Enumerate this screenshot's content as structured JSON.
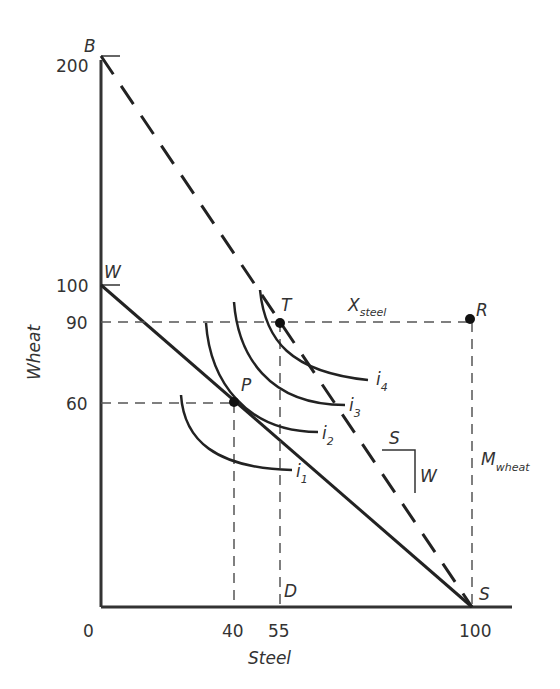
{
  "diagram": {
    "type": "trade-gains-ppf",
    "axes": {
      "x_label": "Steel",
      "y_label": "Wheat",
      "origin_label": "0",
      "x_ticks": [
        "40",
        "55",
        "100"
      ],
      "y_ticks": [
        "200",
        "100",
        "90",
        "60"
      ]
    },
    "points": {
      "B": "B",
      "W": "W",
      "T": "T",
      "P": "P",
      "R": "R",
      "D": "D",
      "S": "S"
    },
    "lines": {
      "production_frontier": "W to S (solid): Wheat 100 to Steel 100",
      "trade_line": "B to S (dashed): Wheat 200 to Steel 100"
    },
    "indifference_curves": {
      "i1": {
        "base": "i",
        "sub": "1"
      },
      "i2": {
        "base": "i",
        "sub": "2"
      },
      "i3": {
        "base": "i",
        "sub": "3"
      },
      "i4": {
        "base": "i",
        "sub": "4"
      }
    },
    "annotations": {
      "x_steel": {
        "base": "X",
        "sub": "steel"
      },
      "m_wheat": {
        "base": "M",
        "sub": "wheat"
      },
      "slope_s": "S",
      "slope_w": "W"
    },
    "coordinates": {
      "P": {
        "steel": 40,
        "wheat": 60
      },
      "T": {
        "steel": 55,
        "wheat": 90
      },
      "R": {
        "steel": 100,
        "wheat": 90
      }
    },
    "colors": {
      "ink": "#333333",
      "dashed": "#555555"
    }
  }
}
